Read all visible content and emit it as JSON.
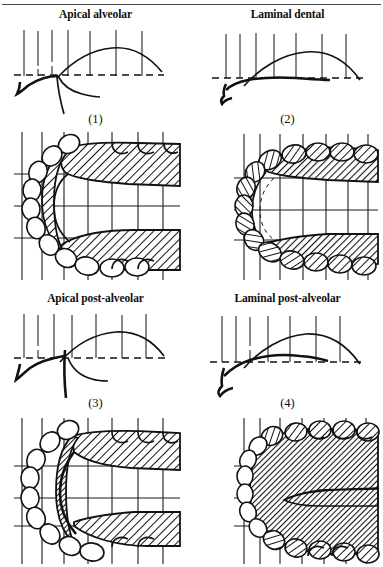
{
  "figure": {
    "type": "phonetics-articulation-figure",
    "layout": "2x2 grid of panels; each panel has a title, a mid-sagittal vocal tract profile diagram, a panel number, and a palatogram below",
    "page_rule_visible": true,
    "panels": [
      {
        "id": "panel-1",
        "number": "(1)",
        "title": "Apical alveolar",
        "sagittal": {
          "dashed_reference_line": true,
          "tick_count": 7,
          "tongue_tip": "apical, raised at alveolar ridge",
          "description": "tongue tip contacts alveolar region; blade lowered"
        },
        "palatogram": {
          "contact_pattern": "narrow band along alveolar ridge and inner margins of the dental arch",
          "contact_extent": "narrow",
          "grid_vertical_lines": 7,
          "grid_horizontal_lines": 3,
          "teeth_outlined": true,
          "teeth_contacted": "none"
        }
      },
      {
        "id": "panel-2",
        "number": "(2)",
        "title": "Laminal dental",
        "sagittal": {
          "dashed_reference_line": true,
          "tick_count": 7,
          "tongue_tip": "laminal, blade raised against upper teeth",
          "description": "tongue blade contacts the upper incisors; tip lowered"
        },
        "palatogram": {
          "contact_pattern": "broad contact over teeth and the front and side regions of the palate",
          "contact_extent": "broad",
          "grid_vertical_lines": 7,
          "grid_horizontal_lines": 3,
          "teeth_outlined": true,
          "teeth_contacted": "all front and lateral teeth shaded"
        }
      },
      {
        "id": "panel-3",
        "number": "(3)",
        "title": "Apical post-alveolar",
        "sagittal": {
          "dashed_reference_line": true,
          "tick_count": 7,
          "tongue_tip": "apical, retracted behind alveolar ridge",
          "description": "tongue tip curled back to the post-alveolar region"
        },
        "palatogram": {
          "contact_pattern": "band set back from the teeth, across the post-alveolar zone and lateral margins",
          "contact_extent": "medium, retracted",
          "grid_vertical_lines": 7,
          "grid_horizontal_lines": 3,
          "teeth_outlined": true,
          "teeth_contacted": "none"
        }
      },
      {
        "id": "panel-4",
        "number": "(4)",
        "title": "Laminal post-alveolar",
        "sagittal": {
          "dashed_reference_line": true,
          "tick_count": 7,
          "tongue_tip": "laminal, blade raised at the post-alveolar region",
          "description": "tongue blade contacts post-alveolar region; wide contact"
        },
        "palatogram": {
          "contact_pattern": "very extensive contact covering teeth and most of the palate, leaving a narrow median channel",
          "contact_extent": "very broad",
          "grid_vertical_lines": 7,
          "grid_horizontal_lines": 3,
          "teeth_outlined": true,
          "teeth_contacted": "all teeth shaded"
        }
      }
    ]
  },
  "colors": {
    "ink": "#121212",
    "page_background": "#ffffff",
    "rule": "#4a4a4a"
  }
}
